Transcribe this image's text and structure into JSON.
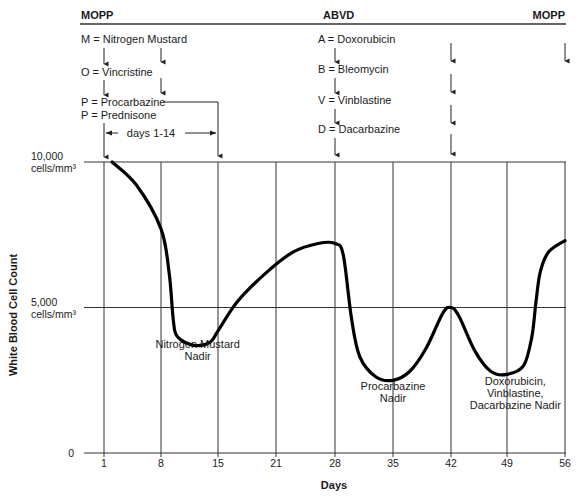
{
  "regimens": [
    {
      "name": "MOPP",
      "x": 81,
      "anchor": "start"
    },
    {
      "name": "ABVD",
      "x": 323,
      "anchor": "start"
    },
    {
      "name": "MOPP",
      "x": 565,
      "anchor": "end"
    }
  ],
  "drugs_mopp": [
    "M = Nitrogen Mustard",
    "O = Vincristine",
    "P = Procarbazine",
    "P = Prednisone"
  ],
  "drugs_abvd": [
    "A = Doxorubicin",
    "B = Bleomycin",
    "V = Vinblastine",
    "D = Dacarbazine"
  ],
  "days_range_label": "days 1-14",
  "annotations": [
    {
      "lines": [
        "Nitrogen Mustard",
        "Nadir"
      ],
      "day": 12.5,
      "y": 348
    },
    {
      "lines": [
        "Procarbazine",
        "Nadir"
      ],
      "day": 35,
      "y": 390
    },
    {
      "lines": [
        "Doxorubicin,",
        "Vinblastine,",
        "Dacarbazine Nadir"
      ],
      "day": 50,
      "y": 385
    }
  ],
  "chart_data": {
    "type": "line",
    "title": "",
    "xlabel": "Days",
    "ylabel": "White Blood Cell Count",
    "x_ticks": [
      1,
      8,
      15,
      21,
      28,
      35,
      42,
      49,
      56
    ],
    "y_ticks": [
      {
        "value": 0,
        "label": "0"
      },
      {
        "value": 5000,
        "label": "5,000 cells/mm³"
      },
      {
        "value": 10000,
        "label": "10,000 cells/mm³"
      }
    ],
    "ylim": [
      0,
      10000
    ],
    "xlim": [
      1,
      56
    ],
    "grid": true,
    "series": [
      {
        "name": "White Blood Cell Count",
        "x": [
          2,
          5,
          8,
          9,
          9.5,
          10,
          12,
          14,
          15,
          17,
          20,
          23,
          26,
          28,
          29,
          30,
          31,
          33,
          35,
          37,
          39,
          41,
          42,
          43,
          45,
          47,
          49,
          51,
          52,
          52.5,
          53,
          54,
          56
        ],
        "values": [
          10000,
          9200,
          7700,
          6200,
          4600,
          4000,
          3700,
          3800,
          4200,
          5200,
          6200,
          6900,
          7200,
          7200,
          6800,
          4600,
          3300,
          2600,
          2500,
          2800,
          3600,
          4800,
          5000,
          4700,
          3500,
          2800,
          2700,
          3000,
          4000,
          5200,
          6200,
          6900,
          7300
        ]
      }
    ],
    "dose_markers": {
      "MOPP_first_cycle": [
        1,
        8,
        15
      ],
      "ABVD": [
        28,
        42
      ],
      "MOPP_next_cycle": [
        56
      ]
    },
    "annotations": [
      "Nitrogen Mustard Nadir",
      "Procarbazine Nadir",
      "Doxorubicin, Vinblastine, Dacarbazine Nadir"
    ]
  }
}
